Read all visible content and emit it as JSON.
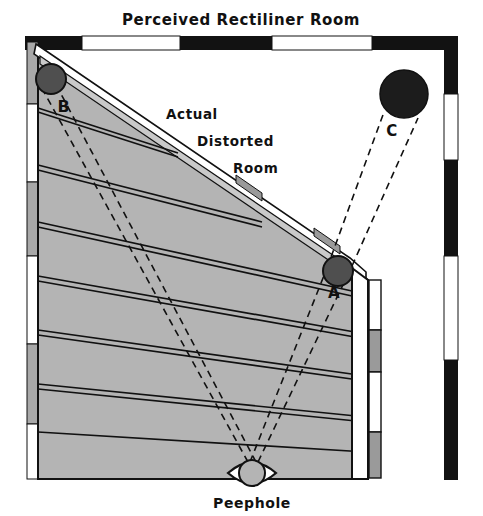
{
  "figure": {
    "title": "Perceived Rectiliner Room",
    "kind": "ames-room-illusion-diagram",
    "annotations": {
      "actual_line1": "Actual",
      "actual_line2": "Distorted",
      "actual_line3": "Room",
      "ball_a": "A",
      "ball_b": "B",
      "ball_c": "C",
      "peephole": "Peephole"
    },
    "colors": {
      "ink": "#111111",
      "floor_gray": "#b4b4b4",
      "wall_gray": "#9a9a9a",
      "ball_dark": "#4f4f4f",
      "ball_black": "#1c1c1c",
      "paper": "#ffffff",
      "border_black": "#121212"
    },
    "perceived_border": {
      "top_segments": [
        {
          "fill": "black",
          "x": 25,
          "w": 57
        },
        {
          "fill": "white",
          "x": 82,
          "w": 98
        },
        {
          "fill": "black",
          "x": 180,
          "w": 92
        },
        {
          "fill": "white",
          "x": 272,
          "w": 100
        },
        {
          "fill": "black",
          "x": 372,
          "w": 86
        }
      ],
      "right_segments": [
        {
          "fill": "black",
          "y": 36,
          "h": 58
        },
        {
          "fill": "white",
          "y": 94,
          "h": 66
        },
        {
          "fill": "black",
          "y": 160,
          "h": 96
        },
        {
          "fill": "white",
          "y": 256,
          "h": 104
        },
        {
          "fill": "black",
          "y": 360,
          "h": 58
        },
        {
          "fill": "white",
          "y": 418,
          "h": 2
        }
      ]
    },
    "inner_wall_segments": [
      {
        "fill": "white",
        "y": 276,
        "h": 52
      },
      {
        "fill": "gray",
        "y": 328,
        "h": 42
      },
      {
        "fill": "white",
        "y": 370,
        "h": 62
      },
      {
        "fill": "gray",
        "y": 432,
        "h": 36
      }
    ],
    "left_wall_segments": [
      {
        "fill": "gray",
        "y": 42,
        "h": 62
      },
      {
        "fill": "white",
        "y": 104,
        "h": 78
      },
      {
        "fill": "gray",
        "y": 182,
        "h": 74
      },
      {
        "fill": "white",
        "y": 256,
        "h": 88
      },
      {
        "fill": "gray",
        "y": 344,
        "h": 80
      },
      {
        "fill": "white",
        "y": 424,
        "h": 52
      }
    ],
    "balls": [
      {
        "label": "A",
        "cx": 338,
        "cy": 271,
        "r": 15,
        "tone": "dark"
      },
      {
        "label": "B",
        "cx": 51,
        "cy": 79,
        "r": 15,
        "tone": "dark"
      },
      {
        "label": "C",
        "cx": 404,
        "cy": 94,
        "r": 24,
        "tone": "black"
      }
    ],
    "peephole": {
      "cx": 252,
      "cy": 473,
      "rx": 24,
      "ry": 16
    }
  }
}
